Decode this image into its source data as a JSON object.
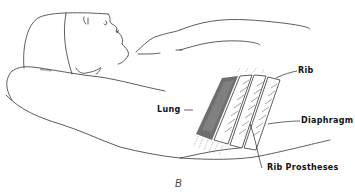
{
  "figure": {
    "caption": "B",
    "pillow_text": "Roomie"
  },
  "labels": {
    "rib": "Rib",
    "lung": "Lung",
    "diaphragm": "Diaphragm",
    "rib_prostheses": "Rib Prostheses"
  },
  "colors": {
    "line": "#222222",
    "background": "#ffffff"
  }
}
